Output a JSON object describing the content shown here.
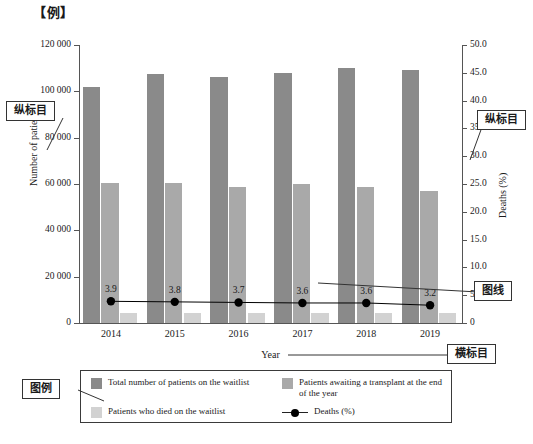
{
  "title": "【例】",
  "annotations": {
    "y_left": "纵标目",
    "y_right": "纵标目",
    "x_axis": "横标目",
    "line_series": "图线",
    "legend": "图例"
  },
  "chart_data": {
    "type": "bar",
    "title": "【例】",
    "xlabel": "Year",
    "ylabel": "Number of patients",
    "y2label": "Deaths (%)",
    "categories": [
      "2014",
      "2015",
      "2016",
      "2017",
      "2018",
      "2019"
    ],
    "ylim": [
      0,
      120000
    ],
    "y2lim": [
      0,
      50.0
    ],
    "yticks": [
      "0",
      "20 000",
      "40 000",
      "60 000",
      "80 000",
      "100 000",
      "120 000"
    ],
    "ytick_values": [
      0,
      20000,
      40000,
      60000,
      80000,
      100000,
      120000
    ],
    "y2ticks": [
      "0",
      "5.0",
      "10.0",
      "15.0",
      "20.0",
      "25.0",
      "30.0",
      "35.0",
      "40.0",
      "45.0",
      "50.0"
    ],
    "y2tick_values": [
      0,
      5,
      10,
      15,
      20,
      25,
      30,
      35,
      40,
      45,
      50
    ],
    "grid": false,
    "legend_position": "bottom",
    "series": [
      {
        "name": "Total number of patients on the waitlist",
        "type": "bar",
        "axis": "left",
        "color": "#8a8a8a",
        "values": [
          102000,
          107500,
          106000,
          107800,
          110000,
          109000
        ]
      },
      {
        "name": "Patients awaiting a transplant at the end of the year",
        "type": "bar",
        "axis": "left",
        "color": "#a9a9a9",
        "values": [
          60500,
          60400,
          58500,
          59800,
          58800,
          57200
        ]
      },
      {
        "name": "Patients who died on the waitlist",
        "type": "bar",
        "axis": "left",
        "color": "#d2d2d2",
        "values": [
          4500,
          4400,
          4300,
          4400,
          4200,
          4300
        ]
      },
      {
        "name": "Deaths (%)",
        "type": "line",
        "axis": "right",
        "color": "#000000",
        "values": [
          3.9,
          3.8,
          3.7,
          3.6,
          3.6,
          3.2
        ],
        "labels": [
          "3.9",
          "3.8",
          "3.7",
          "3.6",
          "3.6",
          "3.2"
        ]
      }
    ]
  }
}
